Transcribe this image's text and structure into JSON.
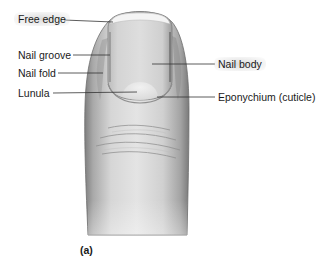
{
  "figure": {
    "panel_label": "(a)",
    "labels": [
      {
        "id": "free-edge",
        "text": "Free edge",
        "side": "left",
        "x": 18,
        "y": 13,
        "highlight": true,
        "line": {
          "x1": 64,
          "y1": 20,
          "x2": 113,
          "y2": 22
        }
      },
      {
        "id": "nail-groove",
        "text": "Nail groove",
        "side": "left",
        "x": 18,
        "y": 49,
        "highlight": false,
        "line": {
          "x1": 73,
          "y1": 55,
          "x2": 110,
          "y2": 55
        }
      },
      {
        "id": "nail-fold",
        "text": "Nail fold",
        "side": "left",
        "x": 18,
        "y": 67,
        "highlight": false,
        "line": {
          "x1": 58,
          "y1": 73,
          "x2": 103,
          "y2": 73
        }
      },
      {
        "id": "lunula",
        "text": "Lunula",
        "side": "left",
        "x": 18,
        "y": 87,
        "highlight": false,
        "line": {
          "x1": 53,
          "y1": 93,
          "x2": 137,
          "y2": 92
        }
      },
      {
        "id": "nail-body",
        "text": "Nail body",
        "side": "right",
        "x": 218,
        "y": 58,
        "highlight": true,
        "line": {
          "x1": 152,
          "y1": 64,
          "x2": 215,
          "y2": 64
        }
      },
      {
        "id": "eponychium",
        "text": "Eponychium (cuticle)",
        "side": "right",
        "x": 218,
        "y": 91,
        "highlight": false,
        "line": {
          "x1": 157,
          "y1": 97,
          "x2": 215,
          "y2": 97
        }
      }
    ]
  },
  "colors": {
    "background": "#ffffff",
    "text": "#1a1a1a",
    "leader_line": "#333333",
    "skin_light": "#e6e6e6",
    "skin_mid": "#c4c4c4",
    "skin_dark": "#8a8a8a",
    "nail": "#d9d9d9",
    "nail_edge": "#f2f2f2",
    "lunula": "#ececec"
  }
}
